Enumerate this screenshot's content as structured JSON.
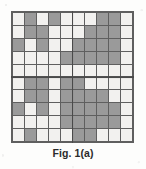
{
  "figure": {
    "caption": "Fig. 1(a)",
    "colors": {
      "light_cell": "#f2f1ef",
      "dark_cell": "#9a9a9a",
      "grid_line": "#5f5f5f",
      "separator": "#4a4a4a",
      "background": "#fdfdfc",
      "caption_text": "#2b2b2b"
    }
  },
  "chart_data": {
    "type": "heatmap",
    "title": "Fig. 1(a)",
    "xlabel": "",
    "ylabel": "",
    "rows": 10,
    "cols": 10,
    "legend": [
      {
        "label": "shaded",
        "value": 1,
        "color": "#9a9a9a"
      },
      {
        "label": "blank",
        "value": 0,
        "color": "#f2f1ef"
      }
    ],
    "grid": true,
    "quadrant_separators": {
      "vertical_after_col": 5,
      "horizontal_after_row": 5
    },
    "values": [
      [
        0,
        1,
        0,
        1,
        0,
        0,
        0,
        1,
        1,
        0
      ],
      [
        0,
        1,
        1,
        0,
        0,
        0,
        1,
        1,
        1,
        0
      ],
      [
        1,
        0,
        1,
        0,
        0,
        1,
        1,
        1,
        1,
        0
      ],
      [
        0,
        0,
        0,
        0,
        1,
        1,
        1,
        1,
        1,
        0
      ],
      [
        0,
        0,
        0,
        0,
        0,
        0,
        0,
        0,
        0,
        0
      ],
      [
        0,
        1,
        1,
        0,
        1,
        1,
        0,
        0,
        0,
        0
      ],
      [
        0,
        1,
        1,
        0,
        1,
        1,
        1,
        1,
        0,
        0
      ],
      [
        1,
        0,
        1,
        0,
        1,
        1,
        1,
        1,
        1,
        0
      ],
      [
        0,
        0,
        0,
        0,
        1,
        1,
        1,
        1,
        1,
        0
      ],
      [
        0,
        1,
        0,
        0,
        0,
        1,
        1,
        0,
        0,
        0
      ]
    ]
  }
}
